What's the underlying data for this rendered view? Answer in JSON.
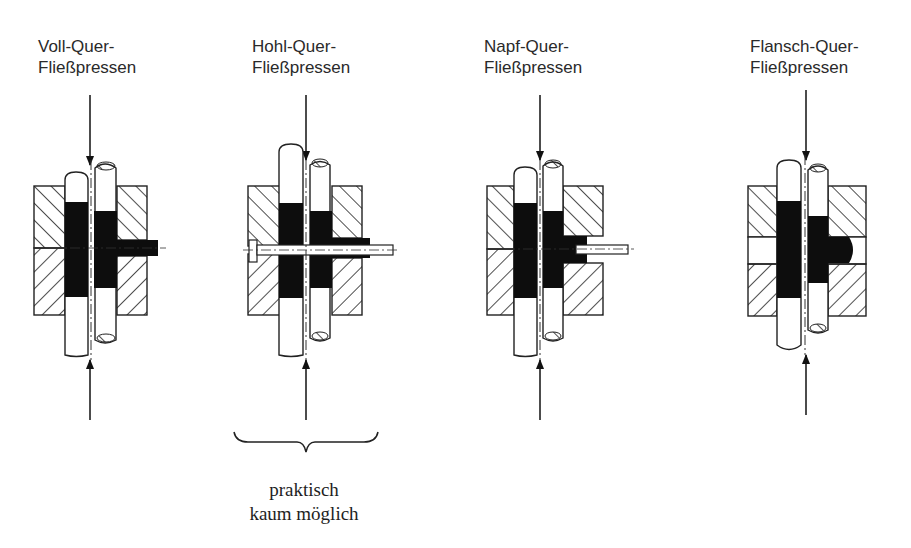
{
  "figure": {
    "colors": {
      "ink": "#1a1a1a",
      "workpiece": "#0d0d0d",
      "background": "#ffffff"
    }
  },
  "variants": [
    {
      "id": "voll",
      "title_line1": "Voll-Quer-",
      "title_line2": "Fließpressen"
    },
    {
      "id": "hohl",
      "title_line1": "Hohl-Quer-",
      "title_line2": "Fließpressen"
    },
    {
      "id": "napf",
      "title_line1": "Napf-Quer-",
      "title_line2": "Fließpressen"
    },
    {
      "id": "flansch",
      "title_line1": "Flansch-Quer-",
      "title_line2": "Fließpressen"
    }
  ],
  "annotation": {
    "line1": "praktisch",
    "line2": "kaum möglich",
    "applies_to": "Hohl-Quer-Fließpressen"
  },
  "legend_parts": {
    "die": "hatched die halves (Matrize)",
    "punches": "upper and lower punches (Stempel)",
    "workpiece": "black workpiece material",
    "force_arrows": "press force from top and bottom"
  }
}
